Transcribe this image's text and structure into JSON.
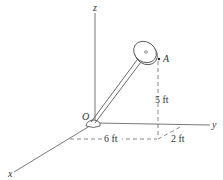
{
  "diagram": {
    "axes": {
      "x_label": "x",
      "y_label": "y",
      "z_label": "z"
    },
    "points": {
      "origin_label": "O",
      "point_a_label": "A"
    },
    "dimensions": {
      "height": "5 ft",
      "x_offset": "6 ft",
      "y_offset": "2 ft"
    },
    "colors": {
      "line": "#444444",
      "background": "#ffffff"
    }
  }
}
